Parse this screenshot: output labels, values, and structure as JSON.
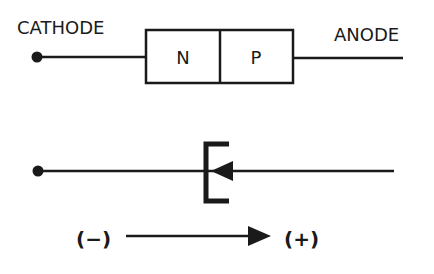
{
  "top_diagram": {
    "cathode_label": "CATHODE",
    "anode_label": "ANODE",
    "n_region_label": "N",
    "p_region_label": "P"
  },
  "bottom_diagram": {
    "symbol": "tunnel-diode-symbol",
    "negative_label": "(−)",
    "positive_label": "(+)"
  },
  "colors": {
    "ink": "#1a1a1a",
    "background": "#ffffff"
  }
}
